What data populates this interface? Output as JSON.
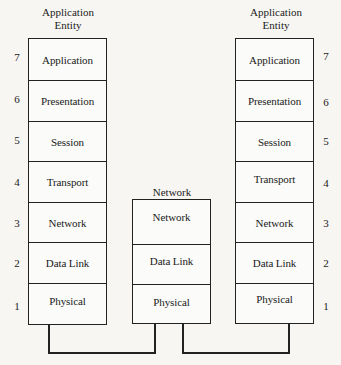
{
  "left_stack": {
    "title_line1": "Application",
    "title_line2": "Entity",
    "layers": [
      {
        "number": "7",
        "label": "Application"
      },
      {
        "number": "6",
        "label": "Presentation"
      },
      {
        "number": "5",
        "label": "Session"
      },
      {
        "number": "4",
        "label": "Transport"
      },
      {
        "number": "3",
        "label": "Network"
      },
      {
        "number": "2",
        "label": "Data Link"
      },
      {
        "number": "1",
        "label": "Physical"
      }
    ]
  },
  "middle_stack": {
    "title": "Network",
    "layers": [
      {
        "label": "Network"
      },
      {
        "label": "Data Link"
      },
      {
        "label": "Physical"
      }
    ]
  },
  "right_stack": {
    "title_line1": "Application",
    "title_line2": "Entity",
    "layers": [
      {
        "number": "7",
        "label": "Application"
      },
      {
        "number": "6",
        "label": "Presentation"
      },
      {
        "number": "5",
        "label": "Session"
      },
      {
        "number": "4",
        "label": "Transport"
      },
      {
        "number": "3",
        "label": "Network"
      },
      {
        "number": "2",
        "label": "Data Link"
      },
      {
        "number": "1",
        "label": "Physical"
      }
    ]
  },
  "colors": {
    "line": "#222222",
    "background": "#f7f6f3"
  }
}
